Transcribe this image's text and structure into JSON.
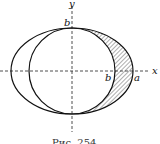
{
  "figure": {
    "labels": {
      "y_axis": "y",
      "x_axis": "x",
      "b_top": "b",
      "b_right": "b",
      "a_right": "a"
    },
    "caption": "Рис. 254",
    "shapes": {
      "ellipse": {
        "semi_major": "a",
        "semi_minor": "b"
      },
      "circle": {
        "radius": "b"
      },
      "shaded_region": "right half between circle and ellipse"
    }
  }
}
